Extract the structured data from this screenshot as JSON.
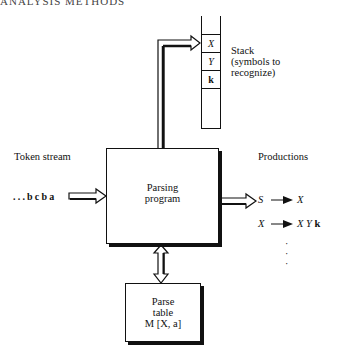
{
  "header": {
    "title": "ANALYSIS METHODS"
  },
  "stack": {
    "label_lines": [
      "Stack",
      "(symbols to",
      "recognize)"
    ],
    "cells": [
      "X",
      "Y",
      "k",
      ""
    ]
  },
  "token_stream": {
    "label": "Token stream",
    "value": "...bcba"
  },
  "parsing_program": {
    "lines": [
      "Parsing",
      "program"
    ]
  },
  "parse_table": {
    "lines": [
      "Parse",
      "table",
      "M [X, a]"
    ]
  },
  "productions": {
    "label": "Productions",
    "rules": [
      {
        "lhs": "S",
        "arrow": "→",
        "rhs": "X"
      },
      {
        "lhs": "X",
        "arrow": "→",
        "rhs": "X Y k"
      }
    ],
    "ellipsis": [
      "·",
      "·",
      "·"
    ]
  },
  "colors": {
    "line": "#111111",
    "background": "#ffffff"
  }
}
